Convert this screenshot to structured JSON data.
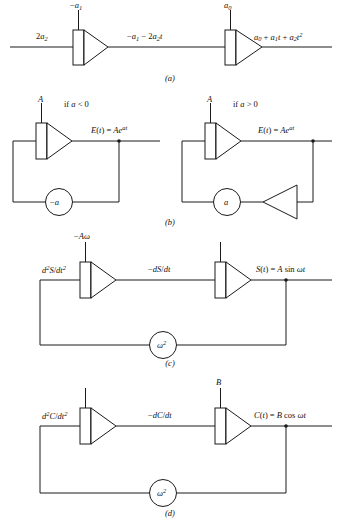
{
  "figure": {
    "type": "analog-computer-block-diagram",
    "line_color": "#1a1a1a",
    "background": "#ffffff",
    "panel_count": 4
  },
  "panels": [
    {
      "id": "a",
      "caption": "(a)",
      "description": "Two cascaded integrators generating a quadratic polynomial",
      "labels": {
        "input": "2a2",
        "ic_first": "-a1",
        "mid": "-a1 - 2a2t",
        "ic_second": "a0",
        "output": "a0 + a1t + a2t^2"
      }
    },
    {
      "id": "b",
      "caption": "(b)",
      "description": "Exponential generator, two cases depending on sign of a",
      "left": {
        "condition": "if a < 0",
        "ic": "A",
        "output": "E(t) = Ae^at",
        "feedback_gain": "-a"
      },
      "right": {
        "condition": "if a > 0",
        "ic": "A",
        "output": "E(t) = Ae^at",
        "feedback_gain": "a",
        "has_inverter": true
      }
    },
    {
      "id": "c",
      "caption": "(c)",
      "description": "Sine wave generator using two integrators and feedback",
      "labels": {
        "ic_first": "-Aw",
        "input": "d2S/dt2",
        "mid": "-dS/dt",
        "ic_second": "",
        "output": "S(t) = A sin wt",
        "feedback_gain": "w^2"
      }
    },
    {
      "id": "d",
      "caption": "(d)",
      "description": "Cosine wave generator using two integrators and feedback",
      "labels": {
        "ic_first": "",
        "input": "d2C/dt2",
        "mid": "-dC/dt",
        "ic_second": "B",
        "output": "C(t) = B cos wt",
        "feedback_gain": "w^2"
      }
    }
  ]
}
